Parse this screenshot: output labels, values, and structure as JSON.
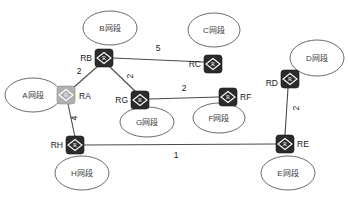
{
  "diagram": {
    "type": "network-topology",
    "router_glyph": "R",
    "colors": {
      "router_fill": "#2b2b2b",
      "router_highlight_fill": "#b0b0b0",
      "link_stroke": "#4a4a4a",
      "segment_stroke": "#5a5a5a",
      "background": "#ffffff",
      "text": "#1a1a1a"
    },
    "routers": [
      {
        "id": "RB",
        "label": "RB",
        "x": 104,
        "y": 58,
        "label_x": 88,
        "label_y": 58,
        "anchor": "end",
        "highlight": false
      },
      {
        "id": "RC",
        "label": "RC",
        "x": 213,
        "y": 64,
        "label_x": 198,
        "label_y": 64,
        "anchor": "end",
        "highlight": false
      },
      {
        "id": "RD",
        "label": "RD",
        "x": 290,
        "y": 79,
        "label_x": 275,
        "label_y": 83,
        "anchor": "end",
        "highlight": false
      },
      {
        "id": "RA",
        "label": "RA",
        "x": 66,
        "y": 95,
        "label_x": 81,
        "label_y": 96,
        "anchor": "start",
        "highlight": true
      },
      {
        "id": "RG",
        "label": "RG",
        "x": 140,
        "y": 100,
        "label_x": 125,
        "label_y": 100,
        "anchor": "end",
        "highlight": false
      },
      {
        "id": "RF",
        "label": "RF",
        "x": 228,
        "y": 97,
        "label_x": 243,
        "label_y": 97,
        "anchor": "start",
        "highlight": false
      },
      {
        "id": "RH",
        "label": "RH",
        "x": 75,
        "y": 145,
        "label_x": 60,
        "label_y": 145,
        "anchor": "end",
        "highlight": false
      },
      {
        "id": "RE",
        "label": "RE",
        "x": 285,
        "y": 144,
        "label_x": 300,
        "label_y": 144,
        "anchor": "start",
        "highlight": false
      }
    ],
    "segments": [
      {
        "id": "B",
        "label": "B网段",
        "x": 110,
        "y": 28,
        "rx": 27,
        "ry": 17
      },
      {
        "id": "C",
        "label": "C网段",
        "x": 214,
        "y": 30,
        "rx": 26,
        "ry": 17
      },
      {
        "id": "D",
        "label": "D网段",
        "x": 317,
        "y": 58,
        "rx": 27,
        "ry": 18
      },
      {
        "id": "A",
        "label": "A网段",
        "x": 33,
        "y": 95,
        "rx": 28,
        "ry": 17
      },
      {
        "id": "G",
        "label": "G网段",
        "x": 147,
        "y": 122,
        "rx": 27,
        "ry": 15
      },
      {
        "id": "F",
        "label": "F网段",
        "x": 219,
        "y": 118,
        "rx": 26,
        "ry": 15
      },
      {
        "id": "H",
        "label": "H网段",
        "x": 82,
        "y": 173,
        "rx": 27,
        "ry": 17
      },
      {
        "id": "E",
        "label": "E网段",
        "x": 288,
        "y": 173,
        "rx": 27,
        "ry": 17
      }
    ],
    "links": [
      {
        "from": "RB",
        "to": "RC",
        "x1": 113,
        "y1": 58,
        "x2": 204,
        "y2": 62,
        "weight": "5",
        "wx": 158,
        "wy": 48,
        "rotated": false
      },
      {
        "from": "RB",
        "to": "RA",
        "x1": 98,
        "y1": 66,
        "x2": 73,
        "y2": 88,
        "weight": "2",
        "wx": 79,
        "wy": 71,
        "rotated": false
      },
      {
        "from": "RB",
        "to": "RG",
        "x1": 110,
        "y1": 67,
        "x2": 136,
        "y2": 92,
        "weight": "2",
        "wx": 130,
        "wy": 76,
        "rotated": true
      },
      {
        "from": "RG",
        "to": "RF",
        "x1": 149,
        "y1": 99,
        "x2": 219,
        "y2": 97,
        "weight": "2",
        "wx": 184,
        "wy": 88,
        "rotated": false
      },
      {
        "from": "RA",
        "to": "RH",
        "x1": 68,
        "y1": 104,
        "x2": 75,
        "y2": 137,
        "weight": "4",
        "wx": 74,
        "wy": 118,
        "rotated": true
      },
      {
        "from": "RH",
        "to": "RE",
        "x1": 84,
        "y1": 145,
        "x2": 276,
        "y2": 144,
        "weight": "1",
        "wx": 176,
        "wy": 155,
        "rotated": false
      },
      {
        "from": "RD",
        "to": "RE",
        "x1": 288,
        "y1": 88,
        "x2": 285,
        "y2": 135,
        "weight": "2",
        "wx": 296,
        "wy": 108,
        "rotated": true
      }
    ]
  }
}
